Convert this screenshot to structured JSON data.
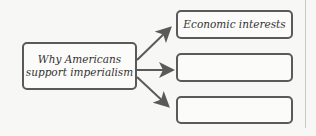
{
  "diagram": {
    "center": {
      "label_line1": "Why Americans",
      "label_line2": "support imperialism"
    },
    "branches": [
      {
        "label": "Economic interests"
      },
      {
        "label": ""
      },
      {
        "label": ""
      }
    ],
    "colors": {
      "stroke": "#5a5a5a",
      "background": "#f7f7f5"
    }
  }
}
